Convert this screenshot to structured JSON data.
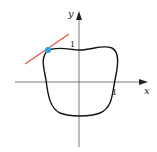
{
  "figure": {
    "axes": {
      "x_label": "x",
      "y_label": "y",
      "x_tick_label": "1",
      "y_tick_label": "1",
      "axis_color": "#555555"
    },
    "curve": {
      "description": "closed rounded curve (heart-like/squarish loop) around origin",
      "color": "#111111"
    },
    "tangent_line": {
      "color": "#e0533f"
    },
    "point": {
      "color": "#2aa3e0"
    }
  }
}
